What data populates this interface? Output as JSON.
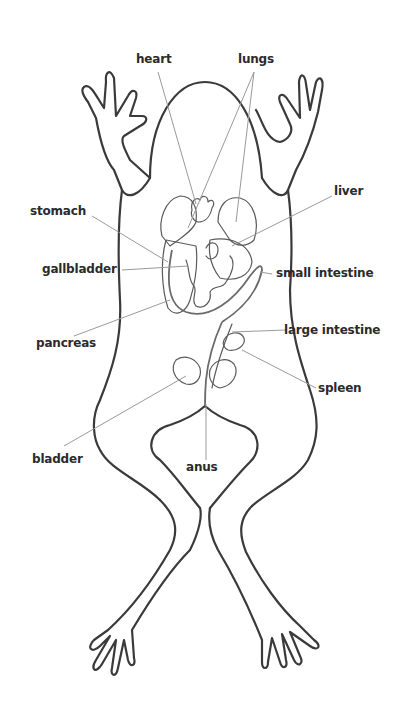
{
  "diagram": {
    "colors": {
      "outline": "#3a3a3a",
      "leader": "#9a9a9a",
      "text": "#2b2b2b",
      "background": "#ffffff"
    },
    "labels": {
      "heart": "heart",
      "lungs": "lungs",
      "liver": "liver",
      "stomach": "stomach",
      "gallbladder": "gallbladder",
      "small_intestine": "small intestine",
      "large_intestine": "large intestine",
      "pancreas": "pancreas",
      "spleen": "spleen",
      "anus": "anus",
      "bladder": "bladder"
    }
  }
}
